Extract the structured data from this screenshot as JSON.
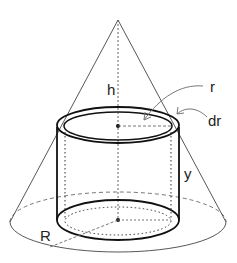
{
  "diagram": {
    "labels": {
      "h": "h",
      "r": "r",
      "dr": "dr",
      "y": "y",
      "R": "R"
    },
    "colors": {
      "stroke": "#222222",
      "background": "#ffffff",
      "arrow": "#777777"
    }
  }
}
